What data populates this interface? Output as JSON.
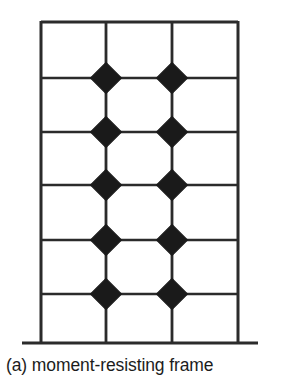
{
  "figure": {
    "label": "(a)",
    "caption": "(a) moment-resisting frame",
    "title_text": "moment-resisting frame",
    "type": "structural-frame-elevation"
  },
  "colors": {
    "line": "#2b2b2b",
    "joint_fill": "#1a1a1a",
    "background": "#ffffff",
    "caption": "#1c1c1c"
  },
  "chart_data": {
    "type": "diagram",
    "title": "(a) moment-resisting frame",
    "bays": 3,
    "stories": 5,
    "columns_x": [
      41,
      106,
      172,
      238
    ],
    "beams_y": [
      22,
      78,
      132,
      185,
      240,
      294
    ],
    "column_base_y": 343,
    "ground_line": {
      "x1": 22,
      "x2": 258,
      "y": 343,
      "stroke_width": 3.2
    },
    "frame_stroke_width": 3.0,
    "beam_stroke_width": 2.6,
    "joint_marker": {
      "shape": "diamond",
      "size": 22,
      "rotation_deg": 45,
      "fill": "#1a1a1a",
      "columns_x": [
        106,
        172
      ],
      "rows_y": [
        78,
        132,
        185,
        240,
        294
      ],
      "count": 10,
      "meaning": "rigid moment connection"
    }
  }
}
